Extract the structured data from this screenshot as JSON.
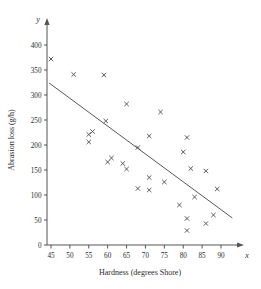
{
  "chart_data": {
    "type": "scatter",
    "title": "",
    "xlabel": "Hardness (degrees Shore)",
    "ylabel": "Abrasion loss (g/h)",
    "x_var_symbol": "x",
    "y_var_symbol": "y",
    "xlim": [
      42,
      94
    ],
    "ylim": [
      0,
      415
    ],
    "xticks": [
      45,
      50,
      55,
      60,
      65,
      70,
      75,
      80,
      85,
      90
    ],
    "yticks": [
      0,
      50,
      100,
      150,
      200,
      250,
      300,
      350,
      400
    ],
    "grid": false,
    "legend": "none",
    "marker_style": "x-cross",
    "points": [
      {
        "x": 45,
        "y": 372
      },
      {
        "x": 51,
        "y": 341
      },
      {
        "x": 59,
        "y": 340
      },
      {
        "x": 65,
        "y": 282
      },
      {
        "x": 74,
        "y": 266
      },
      {
        "x": 59.5,
        "y": 248
      },
      {
        "x": 55,
        "y": 221
      },
      {
        "x": 56,
        "y": 227
      },
      {
        "x": 55,
        "y": 206
      },
      {
        "x": 71,
        "y": 218
      },
      {
        "x": 81,
        "y": 215
      },
      {
        "x": 68,
        "y": 195
      },
      {
        "x": 80,
        "y": 186
      },
      {
        "x": 60,
        "y": 166
      },
      {
        "x": 61,
        "y": 174
      },
      {
        "x": 64,
        "y": 163
      },
      {
        "x": 65,
        "y": 152
      },
      {
        "x": 82,
        "y": 153
      },
      {
        "x": 86,
        "y": 148
      },
      {
        "x": 71,
        "y": 135
      },
      {
        "x": 75,
        "y": 126
      },
      {
        "x": 68,
        "y": 113
      },
      {
        "x": 71,
        "y": 110
      },
      {
        "x": 89,
        "y": 112
      },
      {
        "x": 83,
        "y": 96
      },
      {
        "x": 79,
        "y": 80
      },
      {
        "x": 88,
        "y": 60
      },
      {
        "x": 81,
        "y": 53
      },
      {
        "x": 86,
        "y": 43
      },
      {
        "x": 81,
        "y": 29
      }
    ],
    "fit_line": {
      "type": "linear-regression",
      "x_start": 44.5,
      "y_start": 324,
      "x_end": 93,
      "y_end": 54
    }
  }
}
